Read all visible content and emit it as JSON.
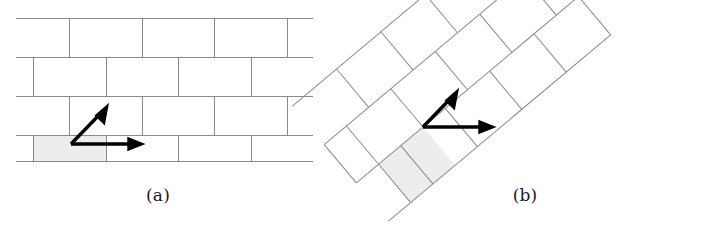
{
  "figure": {
    "type": "diagram",
    "background_color": "#ffffff",
    "line_color": "#808080",
    "arrow_color": "#000000",
    "shaded_cell_fill": "#ededed",
    "shaded_cell_stroke": "#9a9a9a"
  },
  "panels": [
    {
      "id": "panel-a",
      "caption": "(a)",
      "title": "Axis-aligned running-bond brick lattice",
      "lattice": {
        "rotation_deg": 0,
        "brick_width": 72.5,
        "brick_height": 39,
        "row_offset": 36.25,
        "rows": 4,
        "horizontal_line_y": [
          18,
          57,
          96,
          135,
          161
        ],
        "row_joints": [
          [
            69,
            142,
            214,
            287
          ],
          [
            33,
            106,
            178,
            251
          ],
          [
            69,
            142,
            214,
            287
          ],
          [
            33,
            106,
            178,
            251
          ]
        ],
        "x_start": 16,
        "x_end": 313
      },
      "shaded_cell": {
        "x": 33,
        "y": 135,
        "width": 73,
        "height": 26
      },
      "vectors": [
        {
          "name": "vector-a1",
          "origin": [
            71,
            144
          ],
          "tip": [
            140,
            144
          ],
          "label": ""
        },
        {
          "name": "vector-a2",
          "origin": [
            71,
            144
          ],
          "tip": [
            106,
            108
          ],
          "label": ""
        }
      ]
    },
    {
      "id": "panel-b",
      "caption": "(b)",
      "title": "Rotated running-bond brick lattice",
      "lattice": {
        "rotation_deg": -40,
        "brick_width": 58,
        "brick_height": 50,
        "rows": 3,
        "columns": 4
      },
      "shaded_cell": {
        "origin": [
          423,
          127
        ],
        "width": 58,
        "height": 50
      },
      "vectors": [
        {
          "name": "vector-b1",
          "origin": [
            423,
            127
          ],
          "tip": [
            491,
            127
          ],
          "label": ""
        },
        {
          "name": "vector-b2",
          "origin": [
            423,
            127
          ],
          "tip": [
            456,
            92
          ],
          "label": ""
        }
      ]
    }
  ]
}
